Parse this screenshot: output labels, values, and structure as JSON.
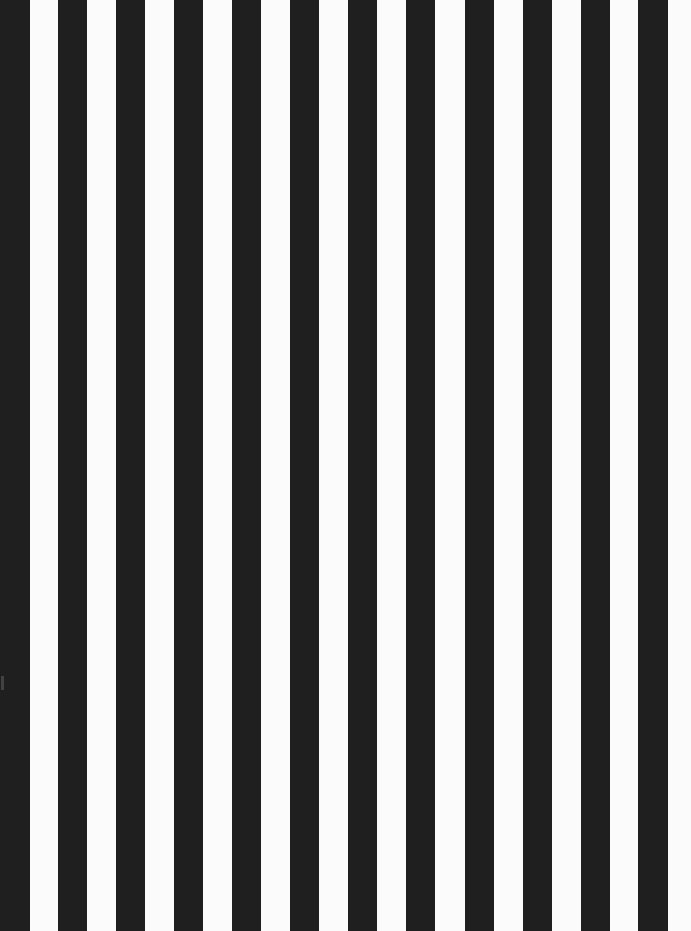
{
  "image": {
    "description": "Vertical black and white stripes",
    "width": 691,
    "height": 931,
    "background_color": "#fbfbfb",
    "stripe_color": "#1f1f1f",
    "stripe_count": 12,
    "stripes": [
      {
        "x": 0,
        "width": 30
      },
      {
        "x": 58,
        "width": 29
      },
      {
        "x": 116,
        "width": 29
      },
      {
        "x": 174,
        "width": 29
      },
      {
        "x": 232,
        "width": 29
      },
      {
        "x": 290,
        "width": 29
      },
      {
        "x": 348,
        "width": 29
      },
      {
        "x": 406,
        "width": 29
      },
      {
        "x": 465,
        "width": 29
      },
      {
        "x": 523,
        "width": 29
      },
      {
        "x": 581,
        "width": 29
      },
      {
        "x": 638,
        "width": 30
      }
    ]
  }
}
